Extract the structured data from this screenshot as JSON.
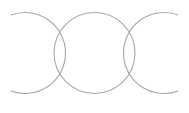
{
  "diagram": {
    "type": "interlocking-rings",
    "background": "#ffffff",
    "stroke_color": "#a8a8a8",
    "stroke_width": 1.1,
    "rings": [
      {
        "name": "left-ring",
        "cx": 29.5,
        "cy": 53,
        "r": 40.5,
        "kind": "arc",
        "arc_start": [
          11,
          15
        ],
        "arc_end": [
          11,
          91
        ],
        "opens": "left"
      },
      {
        "name": "middle-ring",
        "cx": 94.5,
        "cy": 53,
        "r": 40.5,
        "kind": "circle"
      },
      {
        "name": "right-ring",
        "cx": 159.5,
        "cy": 53,
        "r": 40.5,
        "kind": "arc",
        "arc_start": [
          178,
          15
        ],
        "arc_end": [
          178,
          91
        ],
        "opens": "right"
      }
    ]
  }
}
